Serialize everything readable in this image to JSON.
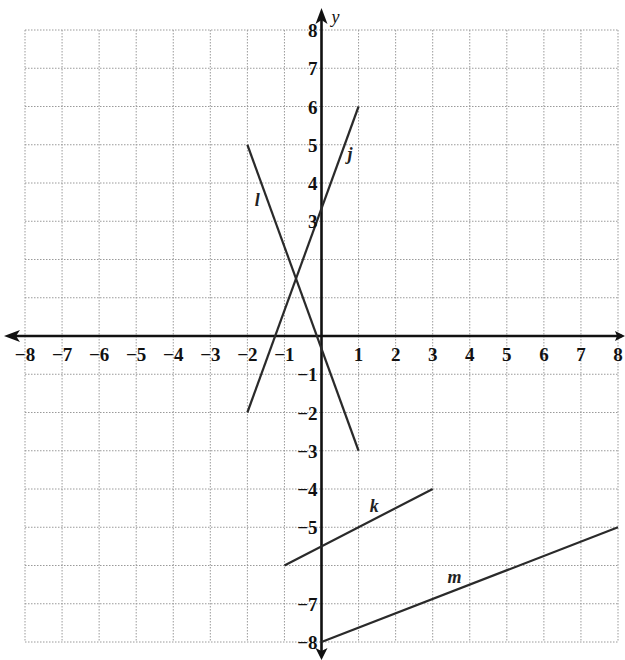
{
  "header": {
    "clipped_text": ""
  },
  "chart_data": {
    "type": "line",
    "title": "",
    "xlabel": "x",
    "ylabel": "y",
    "xlim": [
      -8,
      8
    ],
    "ylim": [
      -8,
      8
    ],
    "grid": true,
    "x_tick_labels": [
      "−8",
      "−7",
      "−6",
      "−5",
      "−4",
      "−3",
      "−2",
      "−1",
      "1",
      "2",
      "3",
      "4",
      "5",
      "6",
      "7",
      "8"
    ],
    "x_ticks": [
      -8,
      -7,
      -6,
      -5,
      -4,
      -3,
      -2,
      -1,
      1,
      2,
      3,
      4,
      5,
      6,
      7,
      8
    ],
    "y_tick_labels": [
      "8",
      "7",
      "6",
      "5",
      "4",
      "3",
      "−1",
      "−2",
      "−3",
      "−4",
      "−5",
      "−7",
      "−8"
    ],
    "y_ticks": [
      8,
      7,
      6,
      5,
      4,
      3,
      -1,
      -2,
      -3,
      -4,
      -5,
      -7,
      -8
    ],
    "series": [
      {
        "name": "j",
        "points": [
          [
            -2,
            -2
          ],
          [
            1,
            6
          ]
        ],
        "label_at": [
          0.7,
          4.6
        ]
      },
      {
        "name": "l",
        "points": [
          [
            -2,
            5
          ],
          [
            1,
            -3
          ]
        ],
        "label_at": [
          -1.8,
          3.4
        ]
      },
      {
        "name": "k",
        "points": [
          [
            -1,
            -6
          ],
          [
            3,
            -4
          ]
        ],
        "label_at": [
          1.3,
          -4.6
        ]
      },
      {
        "name": "m",
        "points": [
          [
            0,
            -8
          ],
          [
            8,
            -5
          ]
        ],
        "label_at": [
          3.4,
          -6.45
        ]
      }
    ]
  }
}
